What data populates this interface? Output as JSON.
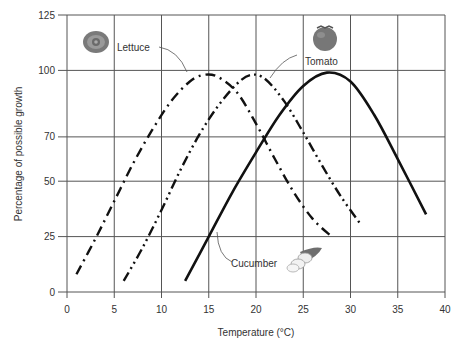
{
  "chart_data": {
    "type": "line",
    "title": "",
    "xlabel": "Temperature (°C)",
    "ylabel": "Percentage of possible growth",
    "xlim": [
      0,
      40
    ],
    "ylim": [
      0,
      125
    ],
    "xticks": [
      0,
      5,
      10,
      15,
      20,
      25,
      30,
      35,
      40
    ],
    "yticks": [
      0,
      25,
      50,
      70,
      100,
      125
    ],
    "grid": true,
    "legend": "inline labels with icons",
    "series": [
      {
        "name": "Lettuce",
        "style": "dash-dot",
        "icon": "lettuce-icon",
        "x": [
          1,
          3,
          5,
          7,
          9,
          11,
          13,
          14.5,
          16,
          18,
          20,
          22,
          24,
          26,
          28
        ],
        "y": [
          8,
          24,
          41,
          58,
          73,
          86,
          95,
          98,
          97,
          90,
          76,
          60,
          45,
          33,
          25
        ]
      },
      {
        "name": "Tomato",
        "style": "dash-dot-dot",
        "icon": "tomato-icon",
        "x": [
          6,
          8,
          10,
          12,
          14,
          16,
          18,
          19.5,
          21,
          23,
          25,
          27,
          29,
          31
        ],
        "y": [
          5,
          20,
          37,
          55,
          71,
          84,
          94,
          98,
          96,
          86,
          72,
          57,
          43,
          31
        ]
      },
      {
        "name": "Cucumber",
        "style": "solid",
        "icon": "cucumber-icon",
        "x": [
          12.5,
          15,
          17.5,
          20,
          22.5,
          25,
          27.5,
          30,
          32.5,
          35,
          38
        ],
        "y": [
          5,
          25,
          45,
          63,
          80,
          93,
          99,
          95,
          80,
          60,
          35
        ]
      }
    ],
    "annotations": [
      {
        "text": "Lettuce",
        "x": 6.5,
        "y": 113
      },
      {
        "text": "Tomato",
        "x": 25,
        "y": 105
      },
      {
        "text": "Cucumber",
        "x": 17.5,
        "y": 19
      }
    ]
  },
  "labels": {
    "xlabel": "Temperature (°C)",
    "ylabel": "Percentage of possible growth",
    "lettuce": "Lettuce",
    "tomato": "Tomato",
    "cucumber": "Cucumber"
  }
}
